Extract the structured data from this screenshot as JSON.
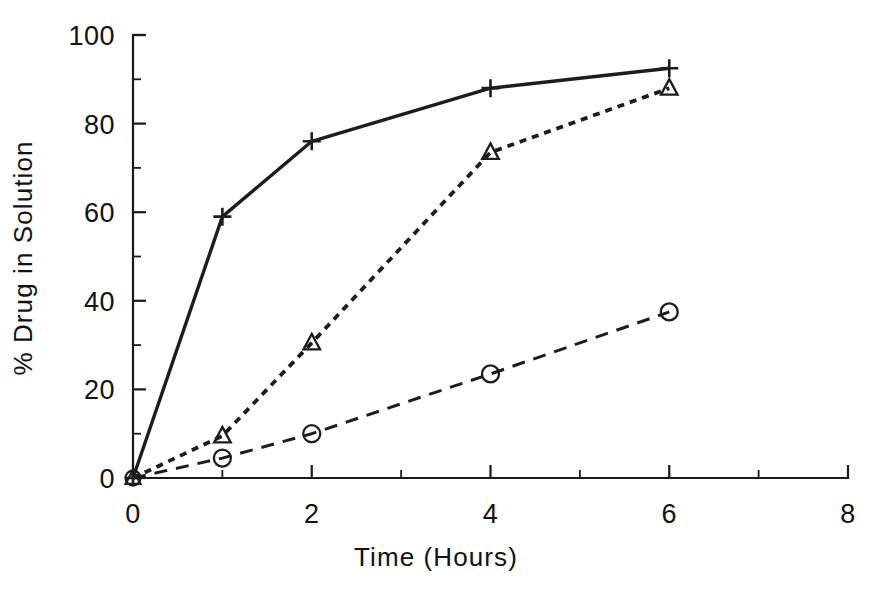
{
  "chart_data": {
    "type": "line",
    "title": "",
    "subtitle": "",
    "xlabel": "Time (Hours)",
    "ylabel": "% Drug in Solution",
    "xlim": [
      0,
      8
    ],
    "ylim": [
      0,
      100
    ],
    "x_major_ticks": [
      0,
      2,
      4,
      6,
      8
    ],
    "x_minor_ticks": [
      1,
      3,
      5,
      7
    ],
    "x_tick_labels": [
      "0",
      "2",
      "4",
      "6",
      "8"
    ],
    "y_major_ticks": [
      0,
      20,
      40,
      60,
      80,
      100
    ],
    "y_minor_ticks": [
      10,
      30,
      50,
      70,
      90
    ],
    "y_tick_labels": [
      "0",
      "20",
      "40",
      "60",
      "80",
      "100"
    ],
    "grid": false,
    "legend": "none",
    "x": [
      0,
      1,
      2,
      4,
      6
    ],
    "series": [
      {
        "name": "plus-series",
        "marker": "plus",
        "linestyle": "solid",
        "color": "#1d1d1d",
        "values": [
          0,
          59,
          76,
          88,
          92.5
        ]
      },
      {
        "name": "triangle-series",
        "marker": "triangle",
        "linestyle": "dotted",
        "color": "#1d1d1d",
        "values": [
          0,
          9.5,
          30.5,
          73.5,
          88
        ]
      },
      {
        "name": "circle-series",
        "marker": "circle",
        "linestyle": "dashed",
        "color": "#1d1d1d",
        "values": [
          0,
          4.5,
          10,
          23.5,
          37.5
        ]
      }
    ]
  },
  "figure": {
    "background_color": "#ffffff",
    "foreground_color": "#1d1d1d"
  }
}
